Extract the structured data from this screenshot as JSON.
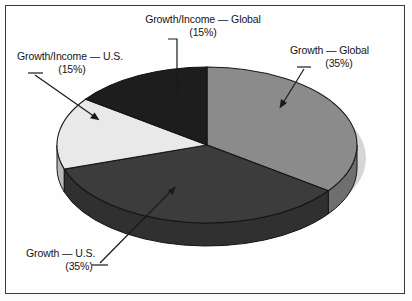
{
  "figure": {
    "background_color": "#fdfdfd",
    "frame_color": "#3b3b3b",
    "width": 412,
    "height": 301
  },
  "chart_data": {
    "type": "pie",
    "title": "",
    "subtitle": "",
    "xlabel": "",
    "ylabel": "",
    "grid": false,
    "legend_position": "none",
    "style": "3d-exploded-none",
    "start_angle_deg": 0,
    "direction": "clockwise",
    "categories": [
      "Growth — Global",
      "Growth — U.S.",
      "Growth/Income — U.S.",
      "Growth/Income — Global"
    ],
    "values": [
      35,
      35,
      15,
      15
    ],
    "units": "percent",
    "total": 100,
    "colors": [
      "#8b8b8b",
      "#3c3c3c",
      "#e9e9e9",
      "#1d1d1d"
    ],
    "side_colors": [
      "#6f6f6f",
      "#303030",
      "#b9b9b9",
      "#181818"
    ],
    "slices": [
      {
        "name": "Growth — Global",
        "value": 35,
        "value_label": "(35%)",
        "color": "#8b8b8b",
        "label_line1": "Growth — Global",
        "label_line2": "(35%)"
      },
      {
        "name": "Growth — U.S.",
        "value": 35,
        "value_label": "(35%)",
        "color": "#3c3c3c",
        "label_line1": "Growth — U.S.",
        "label_line2": "(35%)"
      },
      {
        "name": "Growth/Income — U.S.",
        "value": 15,
        "value_label": "(15%)",
        "color": "#e9e9e9",
        "label_line1": "Growth/Income — U.S.",
        "label_line2": "(15%)"
      },
      {
        "name": "Growth/Income — Global",
        "value": 15,
        "value_label": "(15%)",
        "color": "#1d1d1d",
        "label_line1": "Growth/Income — Global",
        "label_line2": "(15%)"
      }
    ]
  },
  "labels": {
    "growth_income_global": {
      "line1": "Growth/Income — Global",
      "line2": "(15%)"
    },
    "growth_income_us": {
      "line1": "Growth/Income — U.S.",
      "line2": "(15%)"
    },
    "growth_global": {
      "line1": "Growth — Global",
      "line2": "(35%)"
    },
    "growth_us": {
      "line1": "Growth — U.S.",
      "line2": "(35%)"
    }
  }
}
